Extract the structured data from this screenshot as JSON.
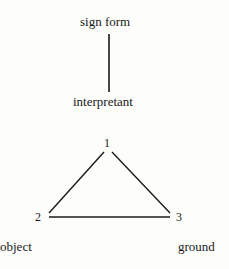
{
  "diagram": {
    "top_label": "sign form",
    "middle_label": "interpretant",
    "vertices": [
      {
        "number": "1",
        "label": ""
      },
      {
        "number": "2",
        "label": "object"
      },
      {
        "number": "3",
        "label": "ground"
      }
    ],
    "stroke_color": "#1a1a1a",
    "text_color": "#1a1a1a"
  }
}
